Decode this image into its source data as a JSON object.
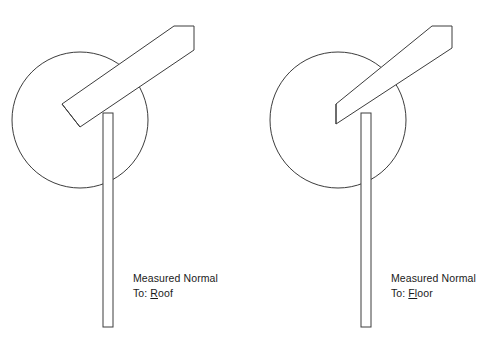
{
  "figure": {
    "type": "line-drawing",
    "background_color": "#ffffff",
    "stroke_color": "#3c3c3c",
    "width": 498,
    "height": 348
  },
  "panels": [
    {
      "id": "roof",
      "caption_line1": "Measured Normal",
      "caption_line2_prefix": "To: ",
      "caption_line2_accel": "R",
      "caption_line2_rest": "oof",
      "caption_text": "Measured Normal To: Roof",
      "caption_x": 133,
      "caption_y": 278,
      "circle": {
        "cx": 80,
        "cy": 120,
        "r": 68
      },
      "post": {
        "x": 103,
        "y": 113,
        "width": 10,
        "height": 214
      },
      "beam_points": "62,104 174,26 194,26 194,50 80,127",
      "beam_end_cut": "perpendicular",
      "beam_inner_line": "62,104 80,127"
    },
    {
      "id": "floor",
      "caption_line1": "Measured Normal",
      "caption_line2_prefix": "To: ",
      "caption_line2_accel": "Fl",
      "caption_line2_rest": "oor",
      "caption_text": "Measured Normal To: Floor",
      "caption_x": 391,
      "caption_y": 278,
      "circle": {
        "cx": 338,
        "cy": 120,
        "r": 68
      },
      "post": {
        "x": 361,
        "y": 113,
        "width": 10,
        "height": 214
      },
      "beam_points": "336,104 432,26 452,26 452,48 336,124",
      "beam_end_cut": "plumb",
      "beam_inner_line": "336,104 336,124"
    }
  ]
}
